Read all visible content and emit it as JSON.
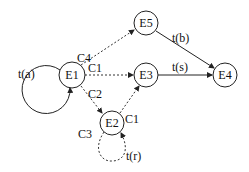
{
  "diagram": {
    "type": "state-transition-graph",
    "nodes": [
      {
        "id": "E1",
        "label": "E1",
        "x": 72,
        "y": 75
      },
      {
        "id": "E2",
        "label": "E2",
        "x": 112,
        "y": 123
      },
      {
        "id": "E3",
        "label": "E3",
        "x": 146,
        "y": 75
      },
      {
        "id": "E4",
        "label": "E4",
        "x": 225,
        "y": 75
      },
      {
        "id": "E5",
        "label": "E5",
        "x": 146,
        "y": 23
      }
    ],
    "edges": [
      {
        "from": "E1",
        "to": "E1",
        "label": "t(a)",
        "style": "solid",
        "kind": "self-loop"
      },
      {
        "from": "E1",
        "to": "E5",
        "label": "C4",
        "style": "dashed"
      },
      {
        "from": "E1",
        "to": "E3",
        "label": "C1",
        "style": "dashed"
      },
      {
        "from": "E1",
        "to": "E2",
        "label": "C2",
        "style": "dashed"
      },
      {
        "from": "E2",
        "to": "E3",
        "label": "C1",
        "style": "dashed"
      },
      {
        "from": "E2",
        "to": "E2",
        "label": "C3",
        "style": "dashed",
        "kind": "self-loop"
      },
      {
        "from": "E2",
        "to": "E2",
        "label": "t(r)",
        "style": "dashed",
        "kind": "self-loop"
      },
      {
        "from": "E5",
        "to": "E4",
        "label": "t(b)",
        "style": "solid"
      },
      {
        "from": "E3",
        "to": "E4",
        "label": "t(s)",
        "style": "solid"
      }
    ],
    "labels": {
      "ta": "t(a)",
      "c4": "C4",
      "c1_top": "C1",
      "c2": "C2",
      "c1_e2": "C1",
      "c3": "C3",
      "tr": "t(r)",
      "tb": "t(b)",
      "ts": "t(s)"
    },
    "node_labels": {
      "e1": "E1",
      "e2": "E2",
      "e3": "E3",
      "e4": "E4",
      "e5": "E5"
    }
  }
}
